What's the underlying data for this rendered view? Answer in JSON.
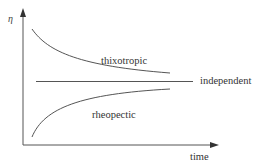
{
  "diagram": {
    "y_axis_label": "η",
    "x_axis_label": "time",
    "curves": [
      {
        "name": "thixotropic",
        "trend": "decreasing",
        "label": "thixotropic"
      },
      {
        "name": "independent",
        "trend": "constant",
        "label": "independent"
      },
      {
        "name": "rheopectic",
        "trend": "increasing",
        "label": "rheopectic"
      }
    ],
    "colors": {
      "line": "#555555",
      "text": "#333333",
      "background": "#ffffff"
    }
  }
}
